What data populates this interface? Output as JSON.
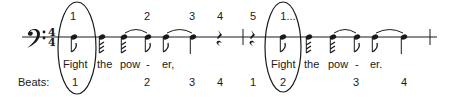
{
  "figure": {
    "clef": "bass-clef",
    "time_signature": {
      "top": "4",
      "bottom": "4"
    },
    "ink_color": "#1a1a1a",
    "count_labels": [
      {
        "text": "1",
        "x": 73
      },
      {
        "text": "2",
        "x": 147
      },
      {
        "text": "3",
        "x": 192
      },
      {
        "text": "4",
        "x": 220
      },
      {
        "text": "5",
        "x": 253
      },
      {
        "text": "1...",
        "x": 288
      }
    ],
    "lyrics": [
      {
        "text": "Fight",
        "x": 63
      },
      {
        "text": "the",
        "x": 98
      },
      {
        "text": "pow",
        "x": 121
      },
      {
        "text": "-",
        "x": 146
      },
      {
        "text": "er,",
        "x": 163
      },
      {
        "text": "Fight",
        "x": 271
      },
      {
        "text": "the",
        "x": 306
      },
      {
        "text": "pow",
        "x": 330
      },
      {
        "text": "-",
        "x": 356
      },
      {
        "text": "er.",
        "x": 372
      }
    ],
    "beats_label": "Beats:",
    "beats": [
      {
        "text": "1",
        "x": 74
      },
      {
        "text": "2",
        "x": 147
      },
      {
        "text": "3",
        "x": 192
      },
      {
        "text": "4",
        "x": 220
      },
      {
        "text": "1",
        "x": 253
      },
      {
        "text": "2",
        "x": 283
      },
      {
        "text": "3",
        "x": 356
      },
      {
        "text": "4",
        "x": 404
      }
    ]
  }
}
